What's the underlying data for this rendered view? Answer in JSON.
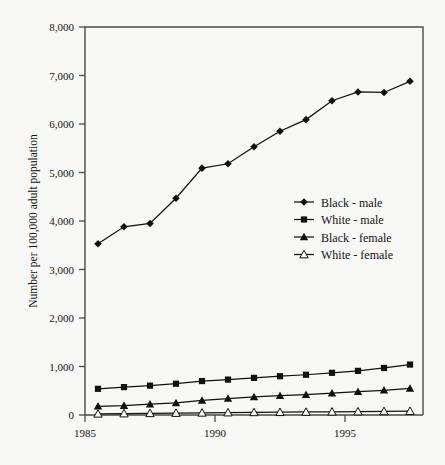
{
  "chart_data": {
    "type": "line",
    "title": "",
    "xlabel": "",
    "ylabel": "Number per 100,000 adult population",
    "xlim": [
      1985,
      1998
    ],
    "ylim": [
      0,
      8000
    ],
    "grid": false,
    "legend_position": "center-right",
    "x_tick_labels": [
      "1985",
      "1990",
      "1995"
    ],
    "x_tick_values": [
      1985,
      1990,
      1995
    ],
    "y_tick_labels": [
      "0",
      "1,000",
      "2,000",
      "3,000",
      "4,000",
      "5,000",
      "6,000",
      "7,000",
      "8,000"
    ],
    "y_tick_values": [
      0,
      1000,
      2000,
      3000,
      4000,
      5000,
      6000,
      7000,
      8000
    ],
    "x": [
      1985.5,
      1986.5,
      1987.5,
      1988.5,
      1989.5,
      1990.5,
      1991.5,
      1992.5,
      1993.5,
      1994.5,
      1995.5,
      1996.5,
      1997.5
    ],
    "series": [
      {
        "name": "Black - male",
        "marker": "diamond-filled",
        "values": [
          3530,
          3880,
          3950,
          4470,
          5090,
          5180,
          5530,
          5850,
          6090,
          6480,
          6660,
          6650,
          6880
        ]
      },
      {
        "name": "White - male",
        "marker": "square-filled",
        "values": [
          540,
          575,
          605,
          645,
          700,
          730,
          765,
          800,
          830,
          870,
          910,
          970,
          1040
        ]
      },
      {
        "name": "Black - female",
        "marker": "triangle-filled",
        "values": [
          180,
          195,
          225,
          250,
          300,
          340,
          375,
          400,
          420,
          450,
          480,
          510,
          550
        ]
      },
      {
        "name": "White - female",
        "marker": "triangle-open",
        "values": [
          25,
          30,
          35,
          40,
          45,
          50,
          55,
          58,
          62,
          66,
          70,
          75,
          80
        ]
      }
    ]
  },
  "legend": {
    "entries": [
      {
        "label": "Black - male"
      },
      {
        "label": "White - male"
      },
      {
        "label": "Black - female"
      },
      {
        "label": "White - female"
      }
    ]
  },
  "style": {
    "line_color": "#111111",
    "axis_color": "#4a4a4a",
    "background": "#f8f8f6"
  }
}
